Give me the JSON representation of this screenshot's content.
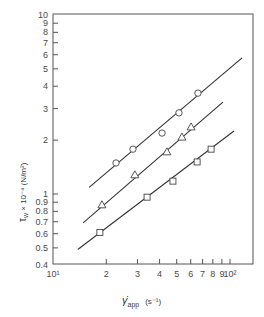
{
  "chart_data": {
    "type": "scatter",
    "title": "",
    "xlabel": "γ̇app (s⁻¹)",
    "ylabel": "τw × 10⁻⁴ (N/m²)",
    "xscale": "log",
    "yscale": "log",
    "xlim": [
      10,
      160
    ],
    "ylim": [
      0.4,
      10
    ],
    "grid": false,
    "legend": null,
    "x_ticks": [
      {
        "value": 10,
        "label": "10¹"
      },
      {
        "value": 20,
        "label": "2"
      },
      {
        "value": 30,
        "label": "3"
      },
      {
        "value": 40,
        "label": "4"
      },
      {
        "value": 50,
        "label": "5"
      },
      {
        "value": 60,
        "label": "6"
      },
      {
        "value": 70,
        "label": "7"
      },
      {
        "value": 80,
        "label": "8"
      },
      {
        "value": 90,
        "label": "9"
      },
      {
        "value": 100,
        "label": "10²"
      }
    ],
    "y_ticks": [
      {
        "value": 0.4,
        "label": "0.4"
      },
      {
        "value": 0.5,
        "label": "0.5"
      },
      {
        "value": 0.6,
        "label": "0.6"
      },
      {
        "value": 0.7,
        "label": "0.7"
      },
      {
        "value": 0.8,
        "label": "0.8"
      },
      {
        "value": 0.9,
        "label": "0.9"
      },
      {
        "value": 1,
        "label": "1"
      },
      {
        "value": 2,
        "label": "2"
      },
      {
        "value": 3,
        "label": "3"
      },
      {
        "value": 4,
        "label": "4"
      },
      {
        "value": 5,
        "label": "5"
      },
      {
        "value": 6,
        "label": "6"
      },
      {
        "value": 7,
        "label": "7"
      },
      {
        "value": 8,
        "label": "8"
      },
      {
        "value": 9,
        "label": "9"
      },
      {
        "value": 10,
        "label": "10"
      }
    ],
    "series": [
      {
        "name": "circles",
        "marker": "circle",
        "x": [
          22.7,
          28.3,
          41.3,
          51.5,
          65.9
        ],
        "y": [
          1.49,
          1.78,
          2.19,
          2.84,
          3.66
        ],
        "fit_line": {
          "x": [
            16.0,
            117.0
          ],
          "y": [
            1.09,
            5.76
          ]
        }
      },
      {
        "name": "triangles",
        "marker": "triangle",
        "x": [
          18.9,
          29.0,
          44.0,
          53.5,
          60.3
        ],
        "y": [
          0.87,
          1.28,
          1.72,
          2.08,
          2.37
        ],
        "fit_line": {
          "x": [
            14.8,
            91.2
          ],
          "y": [
            0.69,
            3.26
          ]
        }
      },
      {
        "name": "squares",
        "marker": "square",
        "x": [
          18.4,
          34.0,
          47.6,
          65.2,
          78.2
        ],
        "y": [
          0.61,
          0.96,
          1.18,
          1.51,
          1.78
        ],
        "fit_line": {
          "x": [
            13.8,
            105.3
          ],
          "y": [
            0.49,
            2.25
          ]
        }
      }
    ]
  },
  "labels": {
    "xlabel_main": "γ̇",
    "xlabel_sub": "app",
    "xlabel_unit": "(s⁻¹)",
    "ylabel_main": "τ",
    "ylabel_sub": "w",
    "ylabel_rest": " × 10⁻⁴ (N/m²)"
  },
  "colors": {
    "axis": "#555555",
    "line": "#333333",
    "marker": "#444444"
  }
}
